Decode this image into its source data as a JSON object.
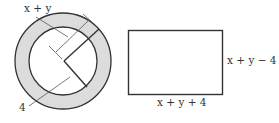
{
  "figure": {
    "ring": {
      "outer_label": "x + y",
      "inner_label": "4",
      "fill_color": "#dcdcdc",
      "stroke_color": "#333333"
    },
    "rectangle": {
      "width_label": "x + y + 4",
      "height_label": "x + y − 4",
      "stroke_color": "#333333"
    }
  }
}
